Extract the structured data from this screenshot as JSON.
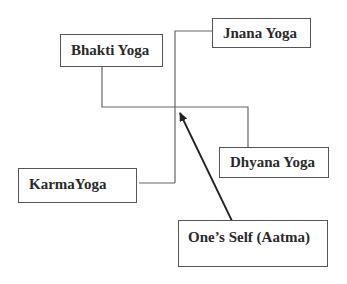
{
  "diagram": {
    "nodes": {
      "bhakti": {
        "label": "Bhakti Yoga"
      },
      "jnana": {
        "label": "Jnana Yoga"
      },
      "dhyana": {
        "label": "Dhyana Yoga"
      },
      "karma": {
        "label": "KarmaYoga"
      },
      "self": {
        "label": "One’s Self (Aatma)"
      }
    },
    "edges": [
      {
        "from": "bhakti",
        "to": "junction",
        "style": "line"
      },
      {
        "from": "jnana",
        "to": "junction",
        "style": "line"
      },
      {
        "from": "dhyana",
        "to": "junction",
        "style": "line"
      },
      {
        "from": "karma",
        "to": "junction",
        "style": "line"
      },
      {
        "from": "self",
        "to": "junction",
        "style": "arrow"
      }
    ],
    "colors": {
      "line": "#666666",
      "arrow": "#222222",
      "border": "#555555",
      "text": "#2a2a2a"
    }
  }
}
